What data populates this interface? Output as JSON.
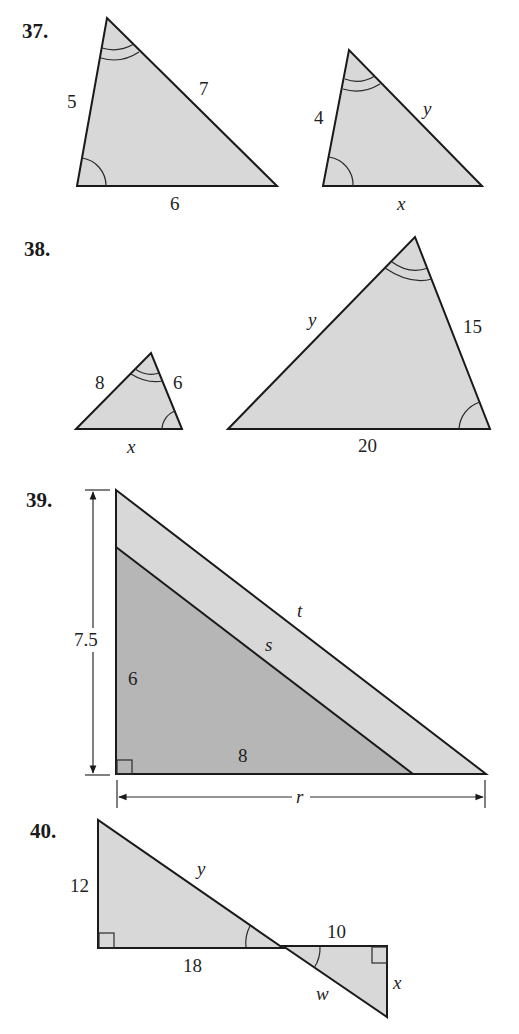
{
  "problems": [
    {
      "number": "37.",
      "description": "Two similar triangles with a single-arc angle at lower left and double-arc angle at top",
      "triangle_1": {
        "left_side": "5",
        "right_side": "7",
        "base": "6"
      },
      "triangle_2": {
        "left_side": "4",
        "right_side": "y",
        "base": "x"
      }
    },
    {
      "number": "38.",
      "description": "Two similar triangles with double-arc angle at apex and single-arc angle at lower right",
      "triangle_1": {
        "left_side": "8",
        "right_side": "6",
        "base": "x"
      },
      "triangle_2": {
        "left_side": "y",
        "right_side": "15",
        "base": "20"
      }
    },
    {
      "number": "39.",
      "description": "Nested right triangles sharing right angle; outer height 7.5, inner legs 6 and 8",
      "outer_height": "7.5",
      "inner_vertical_leg": "6",
      "inner_horizontal_leg": "8",
      "inner_hypotenuse": "s",
      "outer_hypotenuse": "t",
      "outer_base": "r"
    },
    {
      "number": "40.",
      "description": "Two right triangles joined at a vertex with vertical angles",
      "left_triangle": {
        "vertical_leg": "12",
        "base": "18",
        "hypotenuse": "y"
      },
      "right_triangle": {
        "top_leg": "10",
        "vertical_leg": "x",
        "hypotenuse": "w"
      }
    }
  ],
  "colors": {
    "light_fill": "#d8d8d8",
    "dark_fill": "#b6b6b6",
    "stroke": "#1a1a1a"
  }
}
